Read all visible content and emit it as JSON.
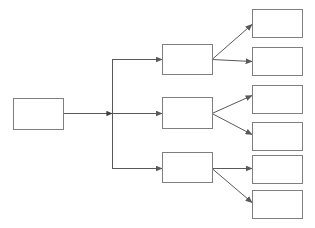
{
  "diagram": {
    "type": "tree",
    "title": "",
    "orientation": "left-to-right",
    "levels": 3,
    "background_color": "#ffffff",
    "box_border_color": "#7f7f7f",
    "box_fill_color": "#ffffff",
    "connector_color": "#595959",
    "box_border_width": 1,
    "connector_width": 1,
    "arrowhead_style": "filled-triangle",
    "canvas": {
      "width": 315,
      "height": 228
    },
    "nodes": {
      "root": {
        "id": "root",
        "label": "",
        "x": 13,
        "y": 98,
        "width": 50,
        "height": 31
      },
      "branches": [
        {
          "id": "branch-1",
          "label": "",
          "x": 162,
          "y": 44,
          "width": 50,
          "height": 30
        },
        {
          "id": "branch-2",
          "label": "",
          "x": 162,
          "y": 97,
          "width": 50,
          "height": 31
        },
        {
          "id": "branch-3",
          "label": "",
          "x": 162,
          "y": 152,
          "width": 50,
          "height": 30
        }
      ],
      "leaves": [
        {
          "id": "leaf-1",
          "label": "",
          "x": 252,
          "y": 9,
          "width": 50,
          "height": 28
        },
        {
          "id": "leaf-2",
          "label": "",
          "x": 252,
          "y": 47,
          "width": 50,
          "height": 28
        },
        {
          "id": "leaf-3",
          "label": "",
          "x": 252,
          "y": 85,
          "width": 50,
          "height": 28
        },
        {
          "id": "leaf-4",
          "label": "",
          "x": 252,
          "y": 122,
          "width": 50,
          "height": 28
        },
        {
          "id": "leaf-5",
          "label": "",
          "x": 252,
          "y": 155,
          "width": 50,
          "height": 28
        },
        {
          "id": "leaf-6",
          "label": "",
          "x": 252,
          "y": 190,
          "width": 50,
          "height": 28
        }
      ]
    },
    "connectors": {
      "trunk": {
        "id": "root-to-branches-trunk",
        "stem_start_x": 63,
        "stem_end_x": 112,
        "stem_y": 113,
        "trunk_x": 112,
        "trunk_top_y": 59,
        "trunk_bottom_y": 168,
        "junction_arrow": {
          "x": 112,
          "y": 113
        }
      },
      "branch_feeds": [
        {
          "id": "trunk-to-branch-1",
          "from_x": 112,
          "to_x": 162,
          "y": 59
        },
        {
          "id": "trunk-to-branch-2",
          "from_x": 112,
          "to_x": 162,
          "y": 113
        },
        {
          "id": "trunk-to-branch-3",
          "from_x": 112,
          "to_x": 162,
          "y": 168
        }
      ],
      "leaf_feeds": [
        {
          "id": "branch-1-to-leaf-1",
          "from_x": 212,
          "from_y": 59,
          "to_x": 252,
          "to_y": 24,
          "shape": "diagonal-up"
        },
        {
          "id": "branch-1-to-leaf-2",
          "from_x": 212,
          "from_y": 59,
          "to_x": 252,
          "to_y": 61,
          "shape": "horizontal"
        },
        {
          "id": "branch-2-to-leaf-3",
          "from_x": 212,
          "from_y": 113,
          "to_x": 252,
          "to_y": 95,
          "shape": "diagonal-up"
        },
        {
          "id": "branch-2-to-leaf-4",
          "from_x": 212,
          "from_y": 113,
          "to_x": 252,
          "to_y": 134,
          "shape": "diagonal-down"
        },
        {
          "id": "branch-3-to-leaf-5",
          "from_x": 212,
          "from_y": 168,
          "to_x": 252,
          "to_y": 168,
          "shape": "horizontal"
        },
        {
          "id": "branch-3-to-leaf-6",
          "from_x": 212,
          "from_y": 168,
          "to_x": 252,
          "to_y": 202,
          "shape": "diagonal-down"
        }
      ]
    }
  }
}
